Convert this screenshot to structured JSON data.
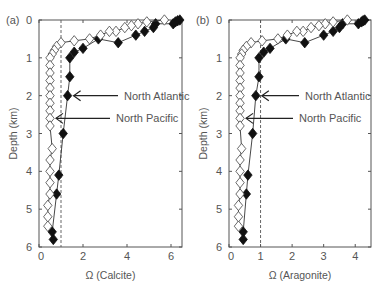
{
  "chart_data": [
    {
      "panel_label": "(a)",
      "type": "scatter",
      "xlabel": "Ω (Calcite)",
      "ylabel": "Depth (km)",
      "xlim": [
        0,
        6.5
      ],
      "ylim": [
        6,
        0
      ],
      "xticks": [
        0,
        2,
        4,
        6
      ],
      "yticks": [
        0,
        1,
        2,
        3,
        4,
        5,
        6
      ],
      "reference_line_x": 1,
      "series": [
        {
          "name": "North Atlantic",
          "marker": "filled-diamond",
          "points": [
            [
              6.4,
              0.0
            ],
            [
              6.3,
              0.02
            ],
            [
              6.2,
              0.05
            ],
            [
              6.1,
              0.1
            ],
            [
              5.3,
              0.1
            ],
            [
              5.2,
              0.2
            ],
            [
              4.8,
              0.3
            ],
            [
              4.4,
              0.4
            ],
            [
              3.6,
              0.6
            ],
            [
              2.7,
              0.5
            ],
            [
              2.0,
              0.75
            ],
            [
              1.6,
              0.85
            ],
            [
              1.4,
              1.0
            ],
            [
              1.4,
              1.5
            ],
            [
              1.3,
              2.0
            ],
            [
              1.1,
              3.0
            ],
            [
              0.9,
              4.1
            ],
            [
              0.8,
              4.6
            ],
            [
              0.6,
              5.6
            ],
            [
              0.65,
              5.8
            ]
          ]
        },
        {
          "name": "North Pacific",
          "marker": "open-diamond",
          "points": [
            [
              5.7,
              0.0
            ],
            [
              4.9,
              0.05
            ],
            [
              4.5,
              0.1
            ],
            [
              4.2,
              0.15
            ],
            [
              3.9,
              0.2
            ],
            [
              3.5,
              0.3
            ],
            [
              3.2,
              0.3
            ],
            [
              2.8,
              0.4
            ],
            [
              2.3,
              0.5
            ],
            [
              1.6,
              0.55
            ],
            [
              1.0,
              0.6
            ],
            [
              0.8,
              0.7
            ],
            [
              0.7,
              0.8
            ],
            [
              0.6,
              0.9
            ],
            [
              0.5,
              1.0
            ],
            [
              0.5,
              1.2
            ],
            [
              0.5,
              1.4
            ],
            [
              0.5,
              1.6
            ],
            [
              0.5,
              1.8
            ],
            [
              0.5,
              2.0
            ],
            [
              0.5,
              2.2
            ],
            [
              0.5,
              2.4
            ],
            [
              0.5,
              2.6
            ],
            [
              0.5,
              2.8
            ],
            [
              0.6,
              3.4
            ],
            [
              0.5,
              3.7
            ],
            [
              0.5,
              4.0
            ],
            [
              0.5,
              4.3
            ],
            [
              0.5,
              4.6
            ],
            [
              0.4,
              4.9
            ],
            [
              0.4,
              5.2
            ],
            [
              0.4,
              5.45
            ]
          ]
        }
      ],
      "annotations": [
        {
          "text": "North Atlantic",
          "arrow_to": [
            1.3,
            2.0
          ]
        },
        {
          "text": "North Pacific",
          "arrow_to": [
            0.5,
            2.6
          ]
        }
      ]
    },
    {
      "panel_label": "(b)",
      "type": "scatter",
      "xlabel": "Ω (Aragonite)",
      "ylabel": "Depth (km)",
      "xlim": [
        0,
        4.5
      ],
      "ylim": [
        6,
        0
      ],
      "xticks": [
        0,
        1,
        2,
        3,
        4
      ],
      "yticks": [
        0,
        1,
        2,
        3,
        4,
        5,
        6
      ],
      "reference_line_x": 1,
      "series": [
        {
          "name": "North Atlantic",
          "marker": "filled-diamond",
          "points": [
            [
              4.3,
              0.0
            ],
            [
              4.25,
              0.02
            ],
            [
              4.2,
              0.05
            ],
            [
              4.1,
              0.1
            ],
            [
              3.6,
              0.1
            ],
            [
              3.5,
              0.2
            ],
            [
              3.3,
              0.3
            ],
            [
              3.0,
              0.4
            ],
            [
              2.4,
              0.6
            ],
            [
              1.8,
              0.5
            ],
            [
              1.3,
              0.75
            ],
            [
              1.1,
              0.85
            ],
            [
              0.95,
              1.0
            ],
            [
              0.95,
              1.5
            ],
            [
              0.85,
              2.0
            ],
            [
              0.75,
              3.0
            ],
            [
              0.6,
              4.1
            ],
            [
              0.55,
              4.6
            ],
            [
              0.45,
              5.6
            ],
            [
              0.45,
              5.8
            ]
          ]
        },
        {
          "name": "North Pacific",
          "marker": "open-diamond",
          "points": [
            [
              3.75,
              0.0
            ],
            [
              3.3,
              0.05
            ],
            [
              3.05,
              0.1
            ],
            [
              2.85,
              0.15
            ],
            [
              2.6,
              0.2
            ],
            [
              2.35,
              0.3
            ],
            [
              2.15,
              0.3
            ],
            [
              1.85,
              0.4
            ],
            [
              1.55,
              0.5
            ],
            [
              1.05,
              0.55
            ],
            [
              0.7,
              0.6
            ],
            [
              0.55,
              0.7
            ],
            [
              0.45,
              0.8
            ],
            [
              0.4,
              0.9
            ],
            [
              0.35,
              1.0
            ],
            [
              0.35,
              1.2
            ],
            [
              0.35,
              1.4
            ],
            [
              0.35,
              1.6
            ],
            [
              0.35,
              1.8
            ],
            [
              0.35,
              2.0
            ],
            [
              0.35,
              2.2
            ],
            [
              0.35,
              2.4
            ],
            [
              0.35,
              2.6
            ],
            [
              0.35,
              2.8
            ],
            [
              0.4,
              3.4
            ],
            [
              0.35,
              3.7
            ],
            [
              0.35,
              4.0
            ],
            [
              0.35,
              4.3
            ],
            [
              0.35,
              4.6
            ],
            [
              0.3,
              4.9
            ],
            [
              0.3,
              5.2
            ],
            [
              0.3,
              5.45
            ]
          ]
        }
      ],
      "annotations": [
        {
          "text": "North Atlantic",
          "arrow_to": [
            0.85,
            2.0
          ]
        },
        {
          "text": "North Pacific",
          "arrow_to": [
            0.35,
            2.6
          ]
        }
      ]
    }
  ],
  "panels": [
    {
      "label": "(a)",
      "xlabel": "Ω (Calcite)",
      "ylabel": "Depth (km)"
    },
    {
      "label": "(b)",
      "xlabel": "Ω (Aragonite)",
      "ylabel": "Depth (km)"
    }
  ],
  "colors": {
    "axis": "#555555",
    "filled_marker": "#111111",
    "open_marker_fill": "#ffffff",
    "line": "#333333",
    "reference_line": "#555555"
  }
}
